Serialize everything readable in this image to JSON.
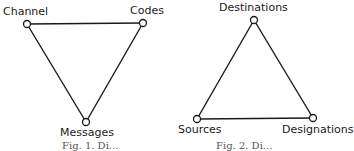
{
  "diagrams": [
    {
      "name": "left-triangle",
      "nodes": [
        {
          "id": "channel",
          "label": "Channel",
          "x": 27,
          "y": 24
        },
        {
          "id": "codes",
          "label": "Codes",
          "x": 143,
          "y": 23
        },
        {
          "id": "messages",
          "label": "Messages",
          "x": 86,
          "y": 122
        }
      ],
      "edges": [
        [
          "channel",
          "codes"
        ],
        [
          "channel",
          "messages"
        ],
        [
          "codes",
          "messages"
        ]
      ],
      "caption": "Fig. 1. Di..."
    },
    {
      "name": "right-triangle",
      "nodes": [
        {
          "id": "destinations",
          "label": "Destinations",
          "x": 254,
          "y": 20
        },
        {
          "id": "sources",
          "label": "Sources",
          "x": 197,
          "y": 119
        },
        {
          "id": "designations",
          "label": "Designations",
          "x": 313,
          "y": 118
        }
      ],
      "edges": [
        [
          "destinations",
          "sources"
        ],
        [
          "destinations",
          "designations"
        ],
        [
          "sources",
          "designations"
        ]
      ],
      "caption": "Fig. 2. Di..."
    }
  ],
  "style": {
    "line_color": "#1a1a1a",
    "node_fill": "#ffffff"
  }
}
